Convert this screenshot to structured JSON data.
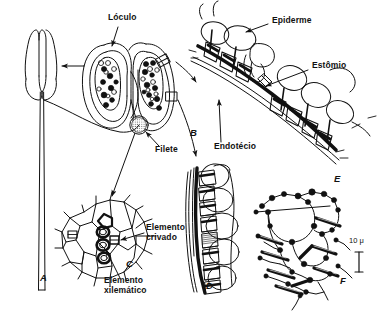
{
  "figure": {
    "background_color": "#ffffff",
    "ink_color": "#111111",
    "scale_bar": {
      "label": "10 μ",
      "x": 352,
      "y": 240
    },
    "labels": [
      {
        "id": "loculo",
        "text": "Lóculo",
        "x": 108,
        "y": 18,
        "align": "left"
      },
      {
        "id": "epiderme",
        "text": "Epiderme",
        "x": 272,
        "y": 21,
        "align": "left"
      },
      {
        "id": "estomio",
        "text": "Estômio",
        "x": 312,
        "y": 66,
        "align": "left"
      },
      {
        "id": "endotecio",
        "text": "Endotécio",
        "x": 216,
        "y": 147,
        "align": "left"
      },
      {
        "id": "filete",
        "text": "Filete",
        "x": 155,
        "y": 150,
        "align": "left"
      },
      {
        "id": "elemento-crivado",
        "text": "Elemento\ncrivado",
        "x": 146,
        "y": 229,
        "align": "left"
      },
      {
        "id": "elemento-xilematico",
        "text": "Elemento\nxilemático",
        "x": 104,
        "y": 281,
        "align": "left"
      }
    ],
    "panel_letters": [
      {
        "id": "panel-a",
        "text": "A",
        "x": 40,
        "y": 277
      },
      {
        "id": "panel-b",
        "text": "B",
        "x": 190,
        "y": 132
      },
      {
        "id": "panel-c",
        "text": "C",
        "x": 126,
        "y": 263
      },
      {
        "id": "panel-d",
        "text": "D",
        "x": 206,
        "y": 285
      },
      {
        "id": "panel-e",
        "text": "E",
        "x": 334,
        "y": 178
      },
      {
        "id": "panel-f",
        "text": "F",
        "x": 340,
        "y": 280
      }
    ]
  }
}
